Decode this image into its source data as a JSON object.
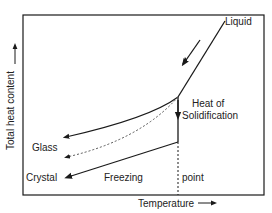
{
  "diagram": {
    "title": "",
    "axes": {
      "x_label": "Temperature",
      "y_label": "Total heat content",
      "x_arrow": "→",
      "y_arrow": "→"
    },
    "labels": {
      "liquid": "Liquid",
      "heat_of": "Heat of",
      "solidification": "Solidification",
      "glass": "Glass",
      "crystal": "Crystal",
      "freezing": "Freezing",
      "point": "point"
    },
    "colors": {
      "line": "#1a1a1a",
      "background": "#ffffff"
    }
  }
}
